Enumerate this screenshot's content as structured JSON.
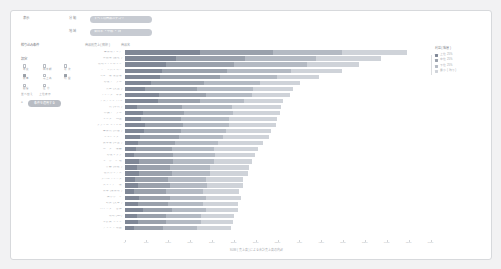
{
  "app": {
    "corner_label": "表示",
    "filters": [
      {
        "label": "分 類",
        "value": "すべての商品カテゴリ",
        "icon": "chevron-down-icon"
      },
      {
        "label": "地 域",
        "value": "東日本 ・ 中部 ・ 西",
        "icon": "chevron-down-icon"
      }
    ]
  },
  "sidebar": {
    "section_filter_label": "絞り込み条件",
    "section_options_label": "設定",
    "checkboxes": [
      {
        "label": "年 度",
        "checked": false
      },
      {
        "label": "四半期",
        "checked": false
      },
      {
        "label": "月 次",
        "checked": false
      },
      {
        "label": "数 量",
        "checked": true
      },
      {
        "label": "売上高",
        "checked": false
      },
      {
        "label": "利 益",
        "checked": true
      },
      {
        "label": "顧 客",
        "checked": false
      },
      {
        "label": "区 分",
        "checked": false
      },
      {
        "label": "地 域",
        "checked": false
      }
    ],
    "sub_labels": [
      "並べ替え",
      "上位表示"
    ],
    "apply_button": {
      "label": "条件を適用する",
      "icon": "filter-icon"
    }
  },
  "legend": {
    "title": "利益 ( 階層 )",
    "items": [
      {
        "label": "上位 25%",
        "color": "#7f8796"
      },
      {
        "label": "中位 25%",
        "color": "#9aa1ac"
      },
      {
        "label": "下位 25%",
        "color": "#b4bac3"
      },
      {
        "label": "最小 ( 残り )",
        "color": "#cfd3d9"
      }
    ]
  },
  "chart_data": {
    "type": "bar",
    "orientation": "horizontal",
    "stacked": true,
    "title": "商品別売上 ( 降順 )",
    "ylabel": "商品名",
    "xlabel": "SUM ( 売上高 ) による合計売上高の内訳",
    "grid": false,
    "legend_position": "right",
    "xlim": [
      0,
      700000
    ],
    "xticks": [
      0,
      50000,
      100000,
      150000,
      200000,
      250000,
      300000,
      350000,
      400000,
      450000,
      500000,
      550000,
      600000,
      650000,
      700000
    ],
    "xtick_labels": [
      "0",
      "50K",
      "100K",
      "150K",
      "200K",
      "250K",
      "300K",
      "350K",
      "400K",
      "450K",
      "500K",
      "550K",
      "600K",
      "650K",
      "700K"
    ],
    "series": [
      {
        "name": "上位 25%",
        "color": "#7f8796"
      },
      {
        "name": "中位 25%",
        "color": "#9aa1ac"
      },
      {
        "name": "下位 25%",
        "color": "#b4bac3"
      },
      {
        "name": "最小 ( 残り )",
        "color": "#cfd3d9"
      }
    ],
    "categories": [
      "事務用チェア",
      "電話機 ( 固定 )",
      "収納キャビネット",
      "ノートパソコン",
      "コピー機 複合機",
      "応接テーブル",
      "書庫 ( 大型 )",
      "プリンター本体",
      "デスクトップ PC",
      "机 ( 平机 )",
      "会議テーブル",
      "モニター 24型",
      "ファイル キャビネ",
      "事務机 ( 両袖 )",
      "シュレッダー",
      "製本機 ( 中型 )",
      "ルーター 機器",
      "応接ソファ",
      "キーボード 類",
      "什器 ( 棚板 )",
      "保管ボックス",
      "ラベルプリンタ",
      "スキャナー 機",
      "電卓 ( 業務用 )",
      "掲示ボード",
      "封筒 ( 大量 )",
      "バインダー 各種",
      "用紙 ( A4 )",
      "筆記具 セット",
      "クリップ 用品"
    ],
    "stacks": [
      [
        172000,
        168000,
        158000,
        148000
      ],
      [
        118000,
        158000,
        162000,
        148000
      ],
      [
        96000,
        154000,
        168000,
        118000
      ],
      [
        86000,
        148000,
        146000,
        118000
      ],
      [
        82000,
        136000,
        132000,
        96000
      ],
      [
        60000,
        122000,
        128000,
        92000
      ],
      [
        48000,
        118000,
        128000,
        92000
      ],
      [
        78000,
        108000,
        106000,
        86000
      ],
      [
        76000,
        96000,
        102000,
        88000
      ],
      [
        28000,
        104000,
        114000,
        112000
      ],
      [
        42000,
        94000,
        112000,
        108000
      ],
      [
        38000,
        92000,
        108000,
        112000
      ],
      [
        46000,
        88000,
        106000,
        106000
      ],
      [
        44000,
        86000,
        102000,
        104000
      ],
      [
        36000,
        88000,
        102000,
        104000
      ],
      [
        32000,
        84000,
        98000,
        102000
      ],
      [
        26000,
        82000,
        96000,
        102000
      ],
      [
        22000,
        88000,
        96000,
        92000
      ],
      [
        34000,
        78000,
        92000,
        88000
      ],
      [
        28000,
        76000,
        92000,
        88000
      ],
      [
        34000,
        74000,
        88000,
        86000
      ],
      [
        24000,
        76000,
        86000,
        86000
      ],
      [
        32000,
        72000,
        84000,
        84000
      ],
      [
        22000,
        74000,
        84000,
        82000
      ],
      [
        34000,
        70000,
        82000,
        80000
      ],
      [
        30000,
        70000,
        80000,
        80000
      ],
      [
        42000,
        66000,
        78000,
        74000
      ],
      [
        28000,
        68000,
        78000,
        76000
      ],
      [
        30000,
        66000,
        78000,
        74000
      ],
      [
        22000,
        66000,
        78000,
        78000
      ]
    ]
  }
}
